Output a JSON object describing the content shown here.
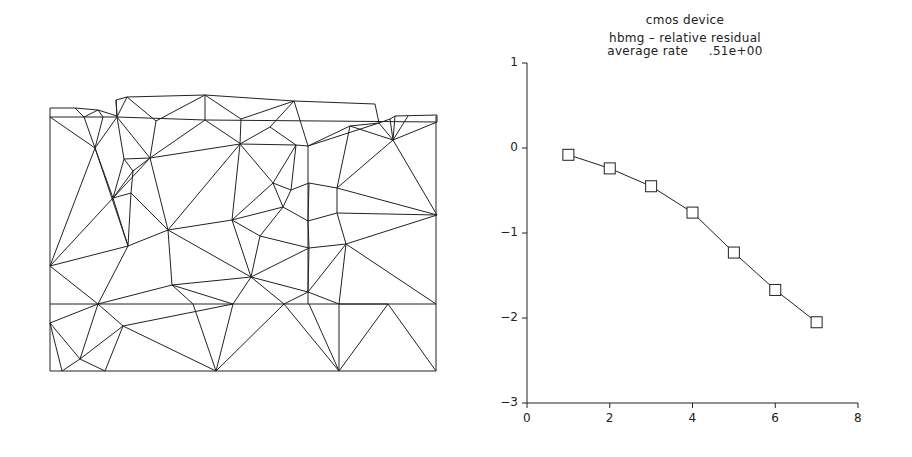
{
  "figure": {
    "left_panel": {
      "description": "triangular finite element mesh",
      "stroke_color": "#222222"
    },
    "right_panel": {
      "title_line1": "cmos device",
      "title_line2": "hbmg – relative residual",
      "title_line3": "average rate     .51e+00"
    }
  },
  "chart_data": {
    "type": "line",
    "xlabel": "",
    "ylabel": "",
    "x": [
      1,
      2,
      3,
      4,
      5,
      6,
      7
    ],
    "series": [
      {
        "name": "relative residual (log10)",
        "marker": "square",
        "values": [
          -0.08,
          -0.24,
          -0.45,
          -0.76,
          -1.23,
          -1.67,
          -2.05
        ]
      }
    ],
    "xlim": [
      0,
      8
    ],
    "ylim": [
      -3,
      1
    ],
    "xticks": [
      "0",
      "2",
      "4",
      "6",
      "8"
    ],
    "yticks": [
      "1",
      "0",
      "-1",
      "-2",
      "-3"
    ],
    "grid": false,
    "legend": "none"
  }
}
